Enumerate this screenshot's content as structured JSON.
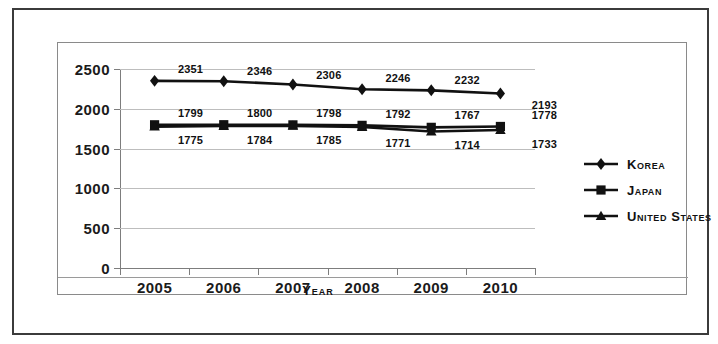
{
  "chart_data": {
    "type": "line",
    "title": "",
    "xlabel": "Year",
    "ylabel": "",
    "categories": [
      "2005",
      "2006",
      "2007",
      "2008",
      "2009",
      "2010"
    ],
    "ylim": [
      0,
      2500
    ],
    "yticks": [
      0,
      500,
      1000,
      1500,
      2000,
      2500
    ],
    "ytick_labels": [
      "0",
      "500",
      "1000",
      "1500",
      "2000",
      "2500"
    ],
    "grid": true,
    "legend_position": "right",
    "series": [
      {
        "name": "Korea",
        "marker": "diamond",
        "color": "#111111",
        "values": [
          2351,
          2346,
          2306,
          2246,
          2232,
          2193
        ],
        "labels": [
          "2351",
          "2346",
          "2306",
          "2246",
          "2232",
          "2193"
        ]
      },
      {
        "name": "Japan",
        "marker": "square",
        "color": "#111111",
        "values": [
          1799,
          1800,
          1798,
          1792,
          1767,
          1778
        ],
        "labels": [
          "1799",
          "1800",
          "1798",
          "1792",
          "1767",
          "1778"
        ]
      },
      {
        "name": "United States",
        "marker": "triangle",
        "color": "#111111",
        "values": [
          1775,
          1784,
          1785,
          1771,
          1714,
          1733
        ],
        "labels": [
          "1775",
          "1784",
          "1785",
          "1771",
          "1714",
          "1733"
        ]
      }
    ]
  },
  "axis": {
    "x_title": "Year"
  },
  "legend": {
    "entries": [
      {
        "label": "Korea",
        "marker": "diamond-marker-icon"
      },
      {
        "label": "Japan",
        "marker": "square-marker-icon"
      },
      {
        "label": "United States",
        "marker": "triangle-marker-icon"
      }
    ]
  },
  "caption": {
    "text": ""
  }
}
